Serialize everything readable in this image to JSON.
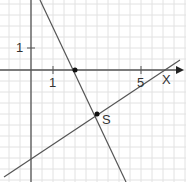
{
  "diagram": {
    "type": "coordinate-plane",
    "axes": {
      "x_label": "x",
      "x_tick_labels": [
        "1",
        "5"
      ],
      "y_tick_labels": [
        "1"
      ]
    },
    "lines": [
      {
        "name": "line-steep",
        "equation": "y = -2x + 4"
      },
      {
        "name": "line-shallow",
        "equation": "y = 2/3 x - 4"
      }
    ],
    "points": [
      {
        "label": "",
        "x": 2,
        "y": 0
      },
      {
        "label": "S",
        "x": 3,
        "y": -2
      }
    ],
    "colors": {
      "grid": "#e2e2e2",
      "axis": "#555555",
      "line": "#555555",
      "point": "#111111"
    }
  }
}
